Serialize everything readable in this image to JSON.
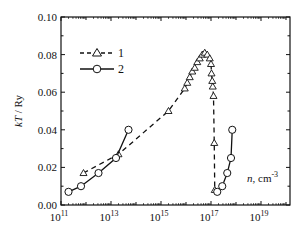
{
  "chart_data": {
    "type": "line",
    "title": "",
    "xlabel": "n, cm^-3",
    "ylabel": "kT / Ry",
    "xscale": "log",
    "xlim_log10": [
      11,
      20.16
    ],
    "ylim": [
      0.0,
      0.1
    ],
    "x_ticks": [
      {
        "exp": 11,
        "label_base": "10",
        "label_exp": "11"
      },
      {
        "exp": 13,
        "label_base": "10",
        "label_exp": "13"
      },
      {
        "exp": 15,
        "label_base": "10",
        "label_exp": "15"
      },
      {
        "exp": 17,
        "label_base": "10",
        "label_exp": "17"
      },
      {
        "exp": 19,
        "label_base": "10",
        "label_exp": "19"
      }
    ],
    "y_ticks": [
      {
        "value": 0.0,
        "label": "0.00"
      },
      {
        "value": 0.02,
        "label": "0.02"
      },
      {
        "value": 0.04,
        "label": "0.04"
      },
      {
        "value": 0.06,
        "label": "0.06"
      },
      {
        "value": 0.08,
        "label": "0.08"
      },
      {
        "value": 0.1,
        "label": "0.10"
      }
    ],
    "grid": false,
    "legend_position": "upper-left-inside",
    "series": [
      {
        "name": "1",
        "marker": "triangle-open",
        "line": "dashed",
        "log10_n": [
          11.9,
          13.3,
          15.3,
          15.95,
          16.05,
          16.15,
          16.25,
          16.35,
          16.45,
          16.55,
          16.65,
          16.75,
          16.85,
          16.95,
          17.0,
          17.02,
          17.05,
          17.07,
          17.1,
          17.13,
          17.15
        ],
        "kT": [
          0.017,
          0.027,
          0.05,
          0.062,
          0.065,
          0.068,
          0.071,
          0.073,
          0.076,
          0.078,
          0.08,
          0.081,
          0.08,
          0.078,
          0.075,
          0.07,
          0.066,
          0.063,
          0.058,
          0.033,
          0.008
        ]
      },
      {
        "name": "2",
        "marker": "circle-open",
        "line": "solid",
        "segments": [
          {
            "log10_n": [
              11.3,
              11.8,
              12.5,
              13.2,
              13.7
            ],
            "kT": [
              0.007,
              0.01,
              0.017,
              0.025,
              0.04
            ]
          },
          {
            "log10_n": [
              17.25,
              17.45,
              17.65,
              17.8,
              17.85
            ],
            "kT": [
              0.007,
              0.01,
              0.017,
              0.025,
              0.04
            ]
          }
        ]
      }
    ],
    "legend": [
      {
        "label": "1",
        "marker": "triangle-open",
        "line": "dashed"
      },
      {
        "label": "2",
        "marker": "circle-open",
        "line": "solid"
      }
    ],
    "annotations": [
      {
        "text": "n, cm",
        "sup": "-3",
        "position": "inside-lower-right"
      }
    ]
  },
  "labels": {
    "ylabel_italic": "kT",
    "ylabel_rest": " / Ry",
    "xlabel_italic": "n",
    "xlabel_rest": ", cm",
    "xlabel_sup": "-3",
    "legend_1": "1",
    "legend_2": "2"
  }
}
